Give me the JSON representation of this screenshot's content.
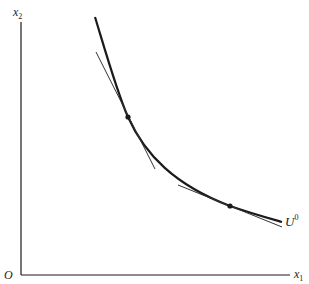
{
  "diagram": {
    "type": "indifference-curve",
    "axes": {
      "origin_label": "O",
      "x_label": "x",
      "x_label_sub": "1",
      "y_label": "x",
      "y_label_sub": "2"
    },
    "curve": {
      "label": "U",
      "label_sup": "0"
    },
    "points": [
      {
        "name": "tangency-point-steep",
        "x": 128,
        "y": 117
      },
      {
        "name": "tangency-point-flat",
        "x": 230,
        "y": 206
      }
    ],
    "colors": {
      "ink": "#1a1a1a",
      "background": "#ffffff"
    }
  }
}
